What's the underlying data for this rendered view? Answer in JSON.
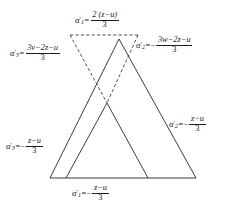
{
  "figure": {
    "name": "triangle-alpha-diagram",
    "background_color": "#ffffff",
    "line_color": "#1a1a1a",
    "text_color": "#1a1a1a",
    "width": 232,
    "height": 211
  },
  "labels": {
    "top": {
      "id": "alpha-1-prime-top",
      "symbol": "α",
      "subscript": "1",
      "prime": "′",
      "relation": "=",
      "sign": "",
      "numerator": "2 (z−u)",
      "denominator": "3",
      "full_text": "α₁′ = 2(z−u)/3"
    },
    "right_upper": {
      "id": "alpha-2-prime-upper-right",
      "symbol": "α",
      "subscript": "2",
      "prime": "′",
      "relation": "=",
      "sign": "−",
      "numerator": "3w−2z−u",
      "denominator": "3",
      "full_text": "α₂′ = −(3w−2z−u)/3"
    },
    "left_upper": {
      "id": "alpha-3-prime-upper-left",
      "symbol": "α",
      "subscript": "3",
      "prime": "′",
      "relation": "=",
      "sign": "",
      "numerator": "3v−2z−u",
      "denominator": "3",
      "full_text": "α₃′ = (3v−2z−u)/3"
    },
    "right_lower": {
      "id": "alpha-2-prime-lower-right",
      "symbol": "α",
      "subscript": "2",
      "prime": "′",
      "relation": "=",
      "sign": "−",
      "numerator": "z−u",
      "denominator": "3",
      "full_text": "α₂′ = −(z−u)/3"
    },
    "left_lower": {
      "id": "alpha-3-prime-lower-left",
      "symbol": "α",
      "subscript": "3",
      "prime": "′",
      "relation": "=",
      "sign": "−",
      "numerator": "z−u",
      "denominator": "3",
      "full_text": "α₃′ = −(z−u)/3"
    },
    "bottom": {
      "id": "alpha-1-prime-bottom",
      "symbol": "α",
      "subscript": "1",
      "prime": "′",
      "relation": "=",
      "sign": "−",
      "numerator": "z−u",
      "denominator": "3",
      "full_text": "α₁′ = −(z−u)/3"
    }
  },
  "geometry": {
    "solid_triangle_outer": {
      "name": "outer-solid-triangle",
      "points": "50,178 119,39 196,178",
      "style": "solid"
    },
    "solid_triangle_inner": {
      "name": "inner-solid-triangle",
      "points": "66,178 107,103 148,178",
      "style": "solid"
    },
    "dashed_triangle": {
      "name": "dashed-inverted-triangle",
      "points": "70,35 138,35 107,103",
      "style": "dashed"
    },
    "dashed_left_edge": {
      "name": "dashed-left-edge",
      "from": "70,35",
      "to": "107,103"
    },
    "dashed_right_edge": {
      "name": "dashed-right-edge",
      "from": "138,35",
      "to": "107,103"
    },
    "dashed_top_edge": {
      "name": "dashed-top-edge",
      "from": "70,35",
      "to": "138,35"
    },
    "baseline": {
      "name": "baseline",
      "from": "50,178",
      "to": "196,178"
    }
  }
}
